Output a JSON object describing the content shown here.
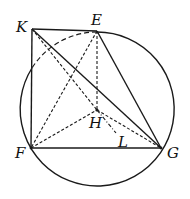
{
  "diagram": {
    "type": "geometry",
    "points": {
      "K": {
        "label": "K",
        "x": 32,
        "y": 29
      },
      "E": {
        "label": "E",
        "x": 97,
        "y": 31
      },
      "H": {
        "label": "H",
        "x": 97,
        "y": 110
      },
      "F": {
        "label": "F",
        "x": 31,
        "y": 148
      },
      "G": {
        "label": "G",
        "x": 161,
        "y": 148
      },
      "L": {
        "label": "L",
        "x": 116,
        "y": 133
      }
    },
    "circle": {
      "cx": 97,
      "cy": 109,
      "r": 77,
      "passes_through": [
        "E",
        "F",
        "G"
      ]
    },
    "solid_segments": [
      [
        "K",
        "E"
      ],
      [
        "K",
        "F"
      ],
      [
        "K",
        "G"
      ],
      [
        "F",
        "G"
      ],
      [
        "E",
        "G"
      ]
    ],
    "dashed_segments": [
      [
        "E",
        "F"
      ],
      [
        "E",
        "H"
      ],
      [
        "F",
        "H"
      ],
      [
        "H",
        "G"
      ],
      [
        "K",
        "H"
      ]
    ],
    "dashdot_segments": [
      [
        "H",
        "L"
      ]
    ],
    "dashed_arc": {
      "from": "E",
      "to": "KF-intersection"
    }
  }
}
